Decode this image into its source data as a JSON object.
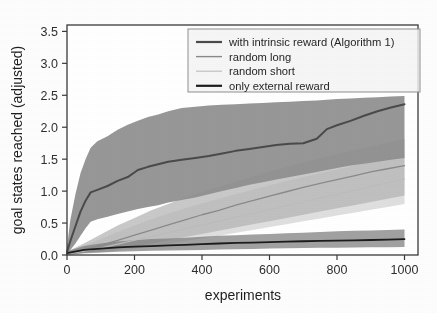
{
  "chart_data": {
    "type": "line",
    "title": "",
    "xlabel": "experiments",
    "ylabel": "goal states reached (adjusted)",
    "xlim": [
      0,
      1040
    ],
    "ylim": [
      0.0,
      3.6
    ],
    "xticks": [
      0,
      200,
      400,
      600,
      800,
      1000
    ],
    "xtick_labels": [
      "0",
      "200",
      "400",
      "600",
      "800",
      "1000"
    ],
    "yticks": [
      0.0,
      0.5,
      1.0,
      1.5,
      2.0,
      2.5,
      3.0,
      3.5
    ],
    "ytick_labels": [
      "0.0",
      "0.5",
      "1.0",
      "1.5",
      "2.0",
      "2.5",
      "3.0",
      "3.5"
    ],
    "grid": false,
    "legend_position": "upper right",
    "series": [
      {
        "name": "with intrinsic reward (Algorithm 1)",
        "color": "#4a4a4a",
        "linewidth": 2.0,
        "band_color": "#8e8e8e",
        "x": [
          0,
          10,
          25,
          40,
          55,
          70,
          90,
          120,
          150,
          180,
          210,
          240,
          270,
          300,
          340,
          380,
          420,
          460,
          500,
          540,
          580,
          620,
          660,
          700,
          740,
          770,
          800,
          840,
          880,
          920,
          960,
          1000
        ],
        "y": [
          0.05,
          0.22,
          0.45,
          0.68,
          0.85,
          0.98,
          1.02,
          1.08,
          1.16,
          1.22,
          1.33,
          1.38,
          1.42,
          1.46,
          1.49,
          1.52,
          1.55,
          1.59,
          1.63,
          1.66,
          1.69,
          1.72,
          1.74,
          1.75,
          1.82,
          1.97,
          2.03,
          2.1,
          2.18,
          2.25,
          2.31,
          2.36
        ],
        "band_upper": [
          0.12,
          0.55,
          0.95,
          1.28,
          1.5,
          1.68,
          1.78,
          1.86,
          1.96,
          2.04,
          2.1,
          2.16,
          2.2,
          2.25,
          2.3,
          2.32,
          2.34,
          2.35,
          2.36,
          2.37,
          2.38,
          2.39,
          2.4,
          2.41,
          2.42,
          2.43,
          2.44,
          2.45,
          2.46,
          2.47,
          2.48,
          2.49
        ],
        "band_lower": [
          0.0,
          0.08,
          0.18,
          0.3,
          0.42,
          0.52,
          0.56,
          0.6,
          0.64,
          0.68,
          0.72,
          0.75,
          0.78,
          0.82,
          0.86,
          0.9,
          0.95,
          1.0,
          1.05,
          1.1,
          1.14,
          1.18,
          1.22,
          1.26,
          1.3,
          1.33,
          1.36,
          1.4,
          1.43,
          1.46,
          1.49,
          1.52
        ]
      },
      {
        "name": "random long",
        "color": "#8a8a8a",
        "linewidth": 1.3,
        "band_color": "#b4b4b4",
        "x": [
          0,
          50,
          100,
          150,
          200,
          250,
          300,
          350,
          400,
          450,
          500,
          550,
          600,
          650,
          700,
          750,
          800,
          850,
          900,
          950,
          1000
        ],
        "y": [
          0.02,
          0.08,
          0.15,
          0.23,
          0.31,
          0.39,
          0.47,
          0.55,
          0.63,
          0.7,
          0.78,
          0.85,
          0.92,
          0.99,
          1.06,
          1.12,
          1.18,
          1.24,
          1.3,
          1.35,
          1.4
        ],
        "band_upper": [
          0.05,
          0.18,
          0.32,
          0.46,
          0.58,
          0.7,
          0.8,
          0.9,
          0.99,
          1.07,
          1.15,
          1.23,
          1.31,
          1.38,
          1.45,
          1.52,
          1.58,
          1.64,
          1.7,
          1.76,
          1.82
        ],
        "band_lower": [
          0.0,
          0.03,
          0.06,
          0.1,
          0.14,
          0.18,
          0.23,
          0.28,
          0.33,
          0.38,
          0.43,
          0.48,
          0.53,
          0.58,
          0.63,
          0.68,
          0.73,
          0.78,
          0.83,
          0.88,
          0.93
        ]
      },
      {
        "name": "random short",
        "color": "#bcbcbc",
        "linewidth": 1.1,
        "band_color": "#d2d2d2",
        "x": [
          0,
          50,
          100,
          150,
          200,
          250,
          300,
          350,
          400,
          450,
          500,
          550,
          600,
          650,
          700,
          750,
          800,
          850,
          900,
          950,
          1000
        ],
        "y": [
          0.02,
          0.06,
          0.11,
          0.17,
          0.23,
          0.29,
          0.35,
          0.41,
          0.47,
          0.53,
          0.59,
          0.65,
          0.71,
          0.77,
          0.83,
          0.89,
          0.95,
          1.01,
          1.07,
          1.13,
          1.19
        ],
        "band_upper": [
          0.04,
          0.14,
          0.25,
          0.36,
          0.46,
          0.56,
          0.65,
          0.73,
          0.81,
          0.88,
          0.95,
          1.02,
          1.09,
          1.16,
          1.22,
          1.28,
          1.34,
          1.4,
          1.46,
          1.52,
          1.58
        ],
        "band_lower": [
          0.0,
          0.02,
          0.04,
          0.07,
          0.1,
          0.14,
          0.18,
          0.22,
          0.26,
          0.3,
          0.35,
          0.39,
          0.44,
          0.48,
          0.53,
          0.57,
          0.62,
          0.66,
          0.71,
          0.75,
          0.8
        ]
      },
      {
        "name": "only external reward",
        "color": "#1c1c1c",
        "linewidth": 1.8,
        "band_color": "#7d7d7d",
        "x": [
          0,
          50,
          100,
          150,
          200,
          250,
          300,
          350,
          400,
          450,
          500,
          550,
          600,
          650,
          700,
          750,
          800,
          850,
          900,
          950,
          1000
        ],
        "y": [
          0.03,
          0.08,
          0.1,
          0.12,
          0.13,
          0.14,
          0.15,
          0.16,
          0.17,
          0.18,
          0.19,
          0.195,
          0.2,
          0.21,
          0.215,
          0.22,
          0.225,
          0.23,
          0.235,
          0.24,
          0.25
        ],
        "band_upper": [
          0.06,
          0.14,
          0.18,
          0.21,
          0.23,
          0.25,
          0.26,
          0.27,
          0.285,
          0.3,
          0.31,
          0.32,
          0.33,
          0.34,
          0.35,
          0.36,
          0.37,
          0.38,
          0.385,
          0.39,
          0.4
        ],
        "band_lower": [
          0.0,
          0.03,
          0.04,
          0.05,
          0.06,
          0.065,
          0.07,
          0.075,
          0.08,
          0.085,
          0.09,
          0.095,
          0.1,
          0.105,
          0.11,
          0.112,
          0.115,
          0.118,
          0.12,
          0.122,
          0.125
        ]
      }
    ]
  },
  "legend": {
    "entries": [
      {
        "label": "with intrinsic reward (Algorithm 1)",
        "color": "#4a4a4a",
        "width": 2.2
      },
      {
        "label": "random long",
        "color": "#8a8a8a",
        "width": 1.4
      },
      {
        "label": "random short",
        "color": "#bdbdbd",
        "width": 1.1
      },
      {
        "label": "only external reward",
        "color": "#1c1c1c",
        "width": 2.2
      }
    ]
  },
  "colors": {
    "background": "#fdfdfb",
    "axis": "#3a3a3a",
    "text": "#222222",
    "legend_frame": "#8f8f8f",
    "legend_fill": "#f4f4f2"
  }
}
